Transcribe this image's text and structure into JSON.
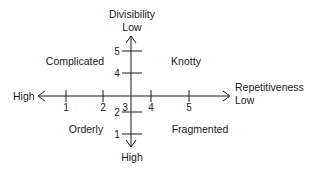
{
  "diagram": {
    "vertical_axis": {
      "title": "Divisibility",
      "top_label": "Low",
      "bottom_label": "High",
      "ticks": [
        "5",
        "4",
        "2",
        "1"
      ]
    },
    "horizontal_axis": {
      "title": "Repetitiveness",
      "right_label": "Low",
      "left_label": "High",
      "ticks": [
        "1",
        "2",
        "3",
        "4",
        "5"
      ]
    },
    "quadrants": {
      "top_left": "Complicated",
      "top_right": "Knotty",
      "bottom_left": "Orderly",
      "bottom_right": "Fragmented"
    },
    "colors": {
      "line": "#1a1a1a",
      "background": "#ffffff"
    }
  }
}
